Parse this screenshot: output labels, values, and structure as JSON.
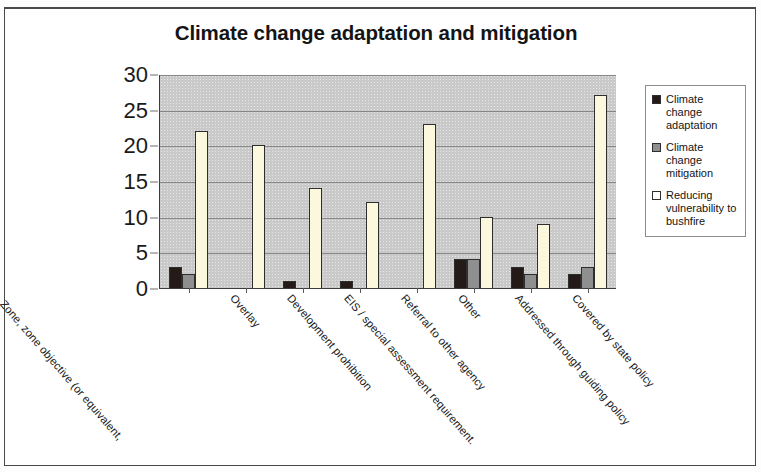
{
  "chart_data": {
    "type": "bar",
    "title": "Climate change adaptation and mitigation",
    "xlabel": "",
    "ylabel": "",
    "ylim": [
      0,
      30
    ],
    "yticks": [
      0,
      5,
      10,
      15,
      20,
      25,
      30
    ],
    "grid": true,
    "legend_position": "right",
    "categories": [
      "Zone, zone objective (or equivalent,",
      "Overlay",
      "Development prohibition",
      "EIS / special assessment requirement.",
      "Referral to other agency",
      "Other",
      "Addressed through guiding policy",
      "Covered by state policy"
    ],
    "series": [
      {
        "name": "Climate change adaptation",
        "color": "#241b18",
        "values": [
          3,
          0,
          1,
          1,
          0,
          4,
          3,
          2
        ]
      },
      {
        "name": "Climate change mitigation",
        "color": "#8f8f8f",
        "values": [
          2,
          0,
          0,
          0,
          0,
          4,
          2,
          3
        ]
      },
      {
        "name": "Reducing vulnerability to bushfire",
        "color": "#fbf8dd",
        "values": [
          22,
          20,
          14,
          12,
          23,
          10,
          9,
          27
        ]
      }
    ]
  }
}
